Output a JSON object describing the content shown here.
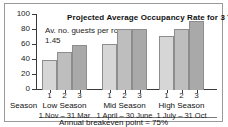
{
  "chart_data": {
    "type": "bar",
    "title": "Projected Average Occupancy Rate for 3 Years",
    "annotation": "Av. no. guests per room 1.45",
    "xlabel": "Season",
    "ylabel": "",
    "ylim": [
      0,
      100
    ],
    "yticks": [
      100,
      80,
      60,
      40,
      20,
      0
    ],
    "grid": false,
    "legend": "none",
    "categories": [
      "Low Season",
      "Mid Season",
      "High Season"
    ],
    "category_dates": [
      "1 Nov – 31 Mar",
      "1 April – 30 June",
      "1 July – 31 Oct"
    ],
    "bar_labels": [
      "1",
      "2",
      "3"
    ],
    "series": [
      {
        "name": "Year 1",
        "color": "#d6d6d6",
        "values": [
          40,
          61,
          72
        ]
      },
      {
        "name": "Year 2",
        "color": "#bebebe",
        "values": [
          51,
          82,
          82
        ]
      },
      {
        "name": "Year 3",
        "color": "#a9a9a9",
        "values": [
          60,
          81,
          92
        ]
      }
    ],
    "groups": [
      {
        "name": "Low Season",
        "dates": "1 Nov – 31 Mar",
        "bars": [
          {
            "label": "1",
            "value": 40
          },
          {
            "label": "2",
            "value": 51
          },
          {
            "label": "3",
            "value": 60
          }
        ]
      },
      {
        "name": "Mid Season",
        "dates": "1 April – 30 June",
        "bars": [
          {
            "label": "1",
            "value": 61
          },
          {
            "label": "2",
            "value": 82
          },
          {
            "label": "3",
            "value": 81
          }
        ]
      },
      {
        "name": "High Season",
        "dates": "1 July – 31 Oct",
        "bars": [
          {
            "label": "1",
            "value": 72
          },
          {
            "label": "2",
            "value": 82
          },
          {
            "label": "3",
            "value": 92
          }
        ]
      }
    ],
    "footnote": "Annual breakeven point = 75%"
  }
}
